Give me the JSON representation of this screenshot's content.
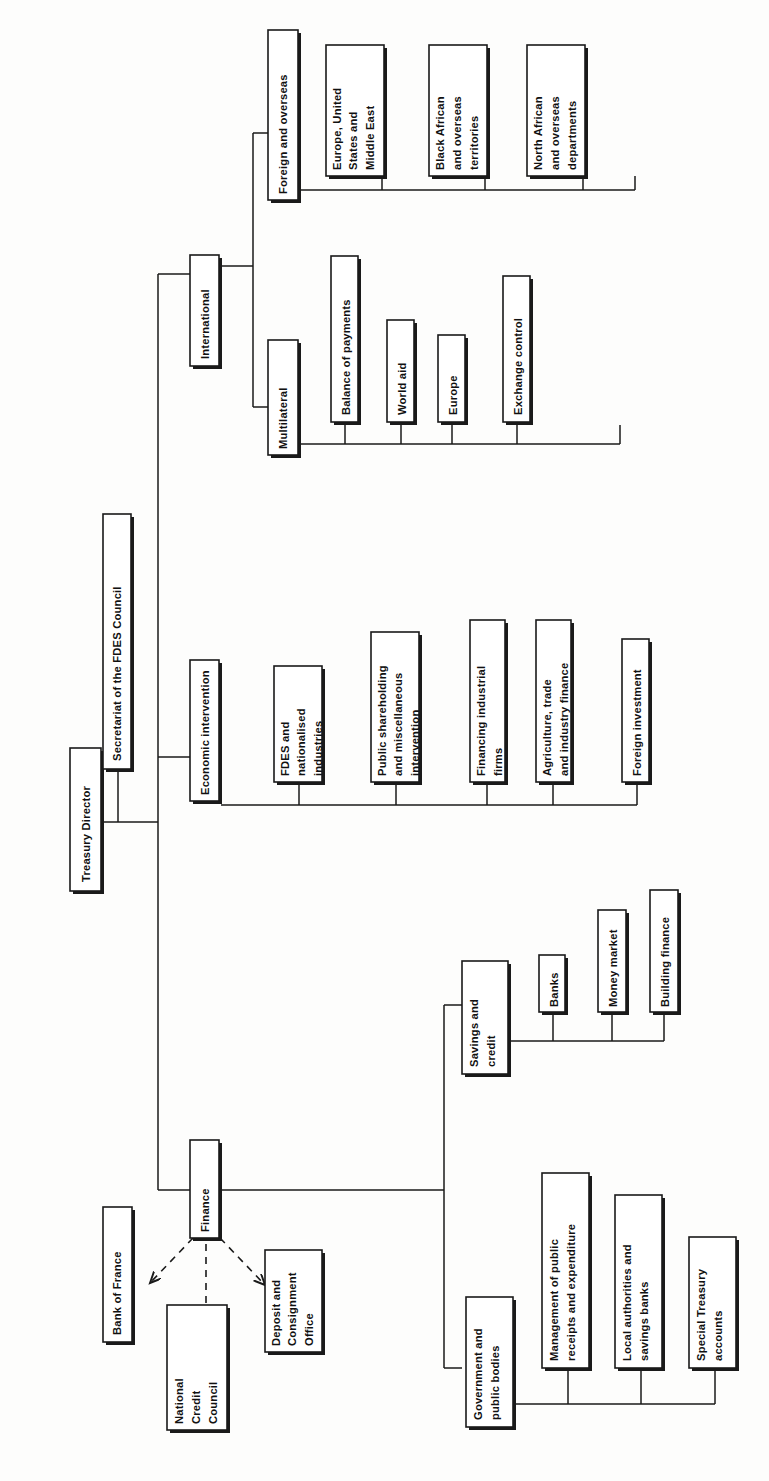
{
  "diagram": {
    "orientation": "rotated-90-ccw",
    "background_color": "#fdfdfc",
    "line_color": "#1a1a1a",
    "box_fill": "#ffffff"
  },
  "nodes": {
    "treasury_director": "Treasury Director",
    "secretariat_fdes": "Secretariat of the FDES Council",
    "international": "International",
    "economic_intervention": "Economic intervention",
    "finance": "Finance",
    "foreign_overseas": "Foreign and overseas",
    "multilateral": "Multilateral",
    "bank_of_france": "Bank of France",
    "national_credit_council": [
      "National",
      "Credit",
      "Council"
    ],
    "deposit_consignment": [
      "Deposit and",
      "Consignment",
      "Office"
    ],
    "savings_credit": [
      "Savings and",
      "credit"
    ],
    "government_public_bodies": [
      "Government and",
      "public bodies"
    ]
  },
  "branches": {
    "foreign_overseas_children": [
      {
        "id": "europe-us-middle-east",
        "lines": [
          "Europe, United",
          "States and",
          "Middle East"
        ]
      },
      {
        "id": "black-african-overseas-territories",
        "lines": [
          "Black African",
          "and overseas",
          "territories"
        ]
      },
      {
        "id": "north-african-overseas-departments",
        "lines": [
          "North African",
          "and overseas",
          "departments"
        ]
      }
    ],
    "multilateral_children": [
      {
        "id": "balance-of-payments",
        "lines": [
          "Balance of payments"
        ]
      },
      {
        "id": "world-aid",
        "lines": [
          "World aid"
        ]
      },
      {
        "id": "europe",
        "lines": [
          "Europe"
        ]
      },
      {
        "id": "exchange-control",
        "lines": [
          "Exchange control"
        ]
      }
    ],
    "economic_intervention_children": [
      {
        "id": "fdes-nationalised-industries",
        "lines": [
          "FDES and",
          "nationalised",
          "industries"
        ]
      },
      {
        "id": "public-shareholding-misc-intervention",
        "lines": [
          "Public shareholding",
          "and miscellaneous",
          "intervention"
        ]
      },
      {
        "id": "financing-industrial-firms",
        "lines": [
          "Financing industrial",
          "firms"
        ]
      },
      {
        "id": "agriculture-trade-industry-finance",
        "lines": [
          "Agriculture, trade",
          "and industry finance"
        ]
      },
      {
        "id": "foreign-investment",
        "lines": [
          "Foreign investment"
        ]
      }
    ],
    "savings_credit_children": [
      {
        "id": "banks",
        "lines": [
          "Banks"
        ]
      },
      {
        "id": "money-market",
        "lines": [
          "Money market"
        ]
      },
      {
        "id": "building-finance",
        "lines": [
          "Building finance"
        ]
      }
    ],
    "government_public_bodies_children": [
      {
        "id": "management-public-receipts-expenditure",
        "lines": [
          "Management of public",
          "receipts and expenditure"
        ]
      },
      {
        "id": "local-authorities-savings-banks",
        "lines": [
          "Local authorities and",
          "savings banks"
        ]
      },
      {
        "id": "special-treasury-accounts",
        "lines": [
          "Special Treasury",
          "accounts"
        ]
      }
    ]
  },
  "relationships": {
    "solid_hierarchy": [
      "Treasury Director -> Secretariat of the FDES Council",
      "Treasury Director -> International",
      "Treasury Director -> Economic intervention",
      "Treasury Director -> Finance",
      "International -> Foreign and overseas",
      "International -> Multilateral",
      "Finance -> Savings and credit",
      "Finance -> Government and public bodies"
    ],
    "dashed_advisory": [
      "Finance <-> Bank of France",
      "Finance <-> National Credit Council",
      "Finance <-> Deposit and Consignment Office"
    ]
  }
}
